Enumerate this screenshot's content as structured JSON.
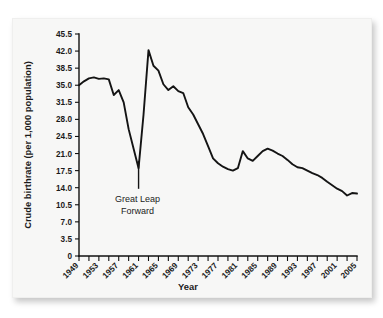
{
  "figure": {
    "background_color": "#f7f7f6",
    "line_color": "#141414",
    "axis_color": "#111111",
    "annotation": {
      "line1": "Great Leap",
      "line2": "Forward"
    }
  },
  "chart_data": {
    "type": "line",
    "title": "",
    "subtitle": "",
    "xlabel": "Year",
    "ylabel": "Crude birthrate (per 1,000 population)",
    "xlim": [
      1949,
      2005
    ],
    "ylim": [
      0,
      45.5
    ],
    "grid": false,
    "legend": null,
    "y_ticks": [
      "0",
      "3.5",
      "7.0",
      "10.5",
      "14.0",
      "17.5",
      "21.0",
      "24.5",
      "28.0",
      "31.5",
      "35.0",
      "38.5",
      "42.0",
      "45.5"
    ],
    "y_tick_values": [
      0,
      3.5,
      7.0,
      10.5,
      14.0,
      17.5,
      21.0,
      24.5,
      28.0,
      31.5,
      35.0,
      38.5,
      42.0,
      45.5
    ],
    "x_tick_labels": [
      "1949",
      "1953",
      "1957",
      "1961",
      "1965",
      "1969",
      "1973",
      "1977",
      "1981",
      "1985",
      "1989",
      "1993",
      "1997",
      "2001",
      "2005"
    ],
    "x_tick_label_values": [
      1949,
      1953,
      1957,
      1961,
      1965,
      1969,
      1973,
      1977,
      1981,
      1985,
      1989,
      1993,
      1997,
      2001,
      2005
    ],
    "x_minor_tick_values": [
      1949,
      1951,
      1953,
      1955,
      1957,
      1959,
      1961,
      1963,
      1965,
      1967,
      1969,
      1971,
      1973,
      1975,
      1977,
      1979,
      1981,
      1983,
      1985,
      1987,
      1989,
      1991,
      1993,
      1995,
      1997,
      1999,
      2001,
      2003,
      2005
    ],
    "annotations": [
      {
        "text": "Great Leap Forward",
        "x": 1961,
        "y": 15.0
      }
    ],
    "x": [
      1949,
      1950,
      1951,
      1952,
      1953,
      1954,
      1955,
      1956,
      1957,
      1958,
      1959,
      1960,
      1961,
      1962,
      1963,
      1964,
      1965,
      1966,
      1967,
      1968,
      1969,
      1970,
      1971,
      1972,
      1973,
      1974,
      1975,
      1976,
      1977,
      1978,
      1979,
      1980,
      1981,
      1982,
      1983,
      1984,
      1985,
      1986,
      1987,
      1988,
      1989,
      1990,
      1991,
      1992,
      1993,
      1994,
      1995,
      1996,
      1997,
      1998,
      1999,
      2000,
      2001,
      2002,
      2003,
      2004,
      2005
    ],
    "values": [
      35.0,
      35.8,
      36.4,
      36.6,
      36.3,
      36.4,
      36.2,
      33.0,
      34.0,
      31.5,
      26.0,
      22.0,
      18.0,
      29.0,
      42.2,
      39.0,
      38.0,
      35.2,
      34.0,
      34.8,
      33.8,
      33.4,
      30.5,
      29.0,
      27.0,
      25.0,
      22.5,
      20.0,
      19.0,
      18.3,
      17.8,
      17.5,
      18.0,
      21.5,
      20.0,
      19.5,
      20.5,
      21.5,
      22.0,
      21.6,
      21.0,
      20.5,
      19.7,
      18.8,
      18.2,
      18.0,
      17.5,
      17.0,
      16.6,
      16.0,
      15.2,
      14.5,
      13.8,
      13.3,
      12.4,
      12.9,
      12.8
    ]
  }
}
